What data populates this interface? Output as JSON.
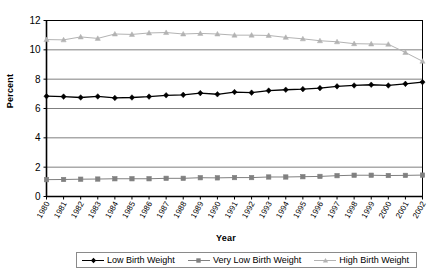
{
  "chart_data": {
    "type": "line",
    "title": "",
    "xlabel": "Year",
    "ylabel": "Percent",
    "grid": true,
    "legend_position": "bottom",
    "ylim": [
      0,
      12
    ],
    "yticks": [
      0,
      2,
      4,
      6,
      8,
      10,
      12
    ],
    "categories": [
      "1980",
      "1981",
      "1982",
      "1983",
      "1984",
      "1985",
      "1986",
      "1987",
      "1988",
      "1989",
      "1990",
      "1991",
      "1992",
      "1993",
      "1994",
      "1995",
      "1996",
      "1997",
      "1998",
      "1999",
      "2000",
      "2001",
      "2002"
    ],
    "series": [
      {
        "name": "Low Birth Weight",
        "marker": "diamond",
        "color": "#000000",
        "values": [
          6.84,
          6.81,
          6.75,
          6.82,
          6.72,
          6.75,
          6.81,
          6.9,
          6.93,
          7.05,
          6.97,
          7.12,
          7.08,
          7.22,
          7.28,
          7.32,
          7.39,
          7.51,
          7.57,
          7.62,
          7.57,
          7.68,
          7.8
        ]
      },
      {
        "name": "Very Low Birth Weight",
        "marker": "square",
        "color": "#808080",
        "values": [
          1.15,
          1.16,
          1.18,
          1.19,
          1.21,
          1.21,
          1.21,
          1.24,
          1.24,
          1.28,
          1.27,
          1.29,
          1.29,
          1.33,
          1.33,
          1.35,
          1.37,
          1.42,
          1.45,
          1.45,
          1.43,
          1.44,
          1.46
        ]
      },
      {
        "name": "High Birth Weight",
        "marker": "triangle",
        "color": "#b3b3b3",
        "values": [
          10.7,
          10.68,
          10.88,
          10.78,
          11.08,
          11.05,
          11.15,
          11.18,
          11.08,
          11.12,
          11.08,
          11.0,
          11.0,
          10.98,
          10.85,
          10.75,
          10.62,
          10.55,
          10.42,
          10.4,
          10.38,
          9.82,
          9.22
        ]
      }
    ]
  },
  "axes": {
    "y_title": "Percent",
    "x_title": "Year"
  },
  "legend": {
    "items": [
      {
        "label": "Low Birth Weight"
      },
      {
        "label": "Very Low Birth Weight"
      },
      {
        "label": "High Birth Weight"
      }
    ]
  }
}
